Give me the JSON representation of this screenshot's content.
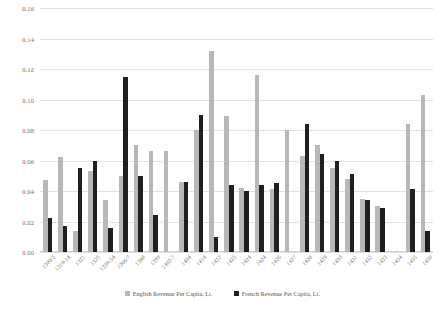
{
  "chart_data": {
    "type": "bar",
    "title": "",
    "xlabel": "",
    "ylabel": "",
    "ylim": [
      0.0,
      0.16
    ],
    "ytick_step": 0.02,
    "grid": true,
    "legend_position": "bottom",
    "ytick_labels": [
      "0.00",
      "0.02",
      "0.04",
      "0.06",
      "0.08",
      "0.10",
      "0.12",
      "0.14",
      "0.16"
    ],
    "categories": [
      "1300/3",
      "1310-14",
      "1321",
      "1325",
      "1338-54",
      "1366/7",
      "1388",
      "1399",
      "1402-7",
      "1404",
      "1414",
      "1422",
      "1423",
      "1424",
      "1424",
      "1426",
      "1427",
      "1428",
      "1429",
      "1430",
      "1431",
      "1432",
      "1433",
      "1434",
      "1435",
      "1436"
    ],
    "series": [
      {
        "name": "English Revenue Per Capita, Lt.",
        "color": "#b8b8b8",
        "values": [
          0.047,
          0.062,
          0.014,
          0.053,
          0.034,
          0.05,
          0.07,
          0.066,
          0.066,
          0.046,
          0.08,
          0.132,
          0.089,
          0.042,
          0.116,
          0.041,
          0.08,
          0.063,
          0.07,
          0.055,
          0.048,
          0.035,
          0.03,
          0.0,
          0.084,
          0.103
        ]
      },
      {
        "name": "French Revenue Per Capita, Lt.",
        "color": "#1f1f1f",
        "values": [
          0.022,
          0.017,
          0.055,
          0.06,
          0.016,
          0.115,
          0.05,
          0.024,
          0.0,
          0.046,
          0.09,
          0.01,
          0.044,
          0.04,
          0.044,
          0.045,
          0.0,
          0.084,
          0.064,
          0.06,
          0.051,
          0.034,
          0.029,
          0.0,
          0.041,
          0.014
        ]
      }
    ]
  },
  "legend": {
    "entries": [
      {
        "label": "English Revenue Per Capita, Lt."
      },
      {
        "label": "French Revenue Per Capita, Lt."
      }
    ]
  }
}
